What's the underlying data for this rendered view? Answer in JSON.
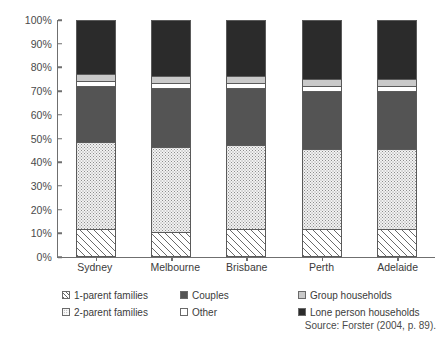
{
  "chart_data": {
    "type": "bar",
    "stacked": true,
    "title": "",
    "subtitle": "",
    "xlabel": "",
    "ylabel": "",
    "ylim": [
      0,
      100
    ],
    "grid": false,
    "legend_position": "bottom",
    "categories": [
      "Sydney",
      "Melbourne",
      "Brisbane",
      "Perth",
      "Adelaide"
    ],
    "y_ticks": [
      "0%",
      "10%",
      "20%",
      "30%",
      "40%",
      "50%",
      "60%",
      "70%",
      "80%",
      "90%",
      "100%"
    ],
    "series": [
      {
        "name": "1-parent families",
        "pattern": "diagonal-hatch",
        "color": "#ffffff",
        "values": [
          11,
          10,
          11,
          11,
          11
        ]
      },
      {
        "name": "2-parent families",
        "pattern": "stipple",
        "color": "#f2f2f2",
        "values": [
          37,
          36,
          36,
          34,
          34
        ]
      },
      {
        "name": "Couples",
        "pattern": "solid",
        "color": "#545454",
        "values": [
          24,
          25,
          24,
          25,
          25
        ]
      },
      {
        "name": "Other",
        "pattern": "solid",
        "color": "#ffffff",
        "values": [
          2,
          2,
          2,
          2,
          2
        ]
      },
      {
        "name": "Group households",
        "pattern": "solid",
        "color": "#c9c9c9",
        "values": [
          3,
          3,
          3,
          3,
          3
        ]
      },
      {
        "name": "Lone person households",
        "pattern": "solid",
        "color": "#2b2b2b",
        "values": [
          23,
          24,
          24,
          25,
          25
        ]
      }
    ]
  },
  "legend": {
    "items": [
      {
        "label": "1-parent families",
        "swatch": "sw-hatch"
      },
      {
        "label": "2-parent families",
        "swatch": "sw-stipple"
      },
      {
        "label": "Couples",
        "swatch": "sw-midgray"
      },
      {
        "label": "Other",
        "swatch": "sw-white"
      },
      {
        "label": "Group households",
        "swatch": "sw-lightgray"
      },
      {
        "label": "Lone person households",
        "swatch": "sw-darkgray"
      }
    ]
  },
  "source": {
    "text": "Source: Forster (2004, p. 89)."
  }
}
